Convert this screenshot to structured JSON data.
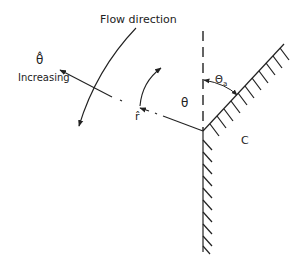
{
  "diagram": {
    "labels": {
      "flow_direction": "Flow direction",
      "theta_hat": "θ̂",
      "increasing": "Increasing",
      "theta": "θ",
      "r_hat": "r̂",
      "theta_a_symbol": "Θ",
      "theta_a_subscript": "a",
      "region": "C"
    },
    "colors": {
      "line": "#222222",
      "background": "#ffffff"
    },
    "elements": [
      "vertical dashed reference line",
      "inclined hatched wall",
      "vertical hatched wall",
      "radial dash-dot ray with r-hat arrow",
      "theta arc arrow",
      "theta_a angle arc between reference and inclined wall",
      "flow direction curved arrow",
      "theta-hat increasing arrow"
    ]
  }
}
